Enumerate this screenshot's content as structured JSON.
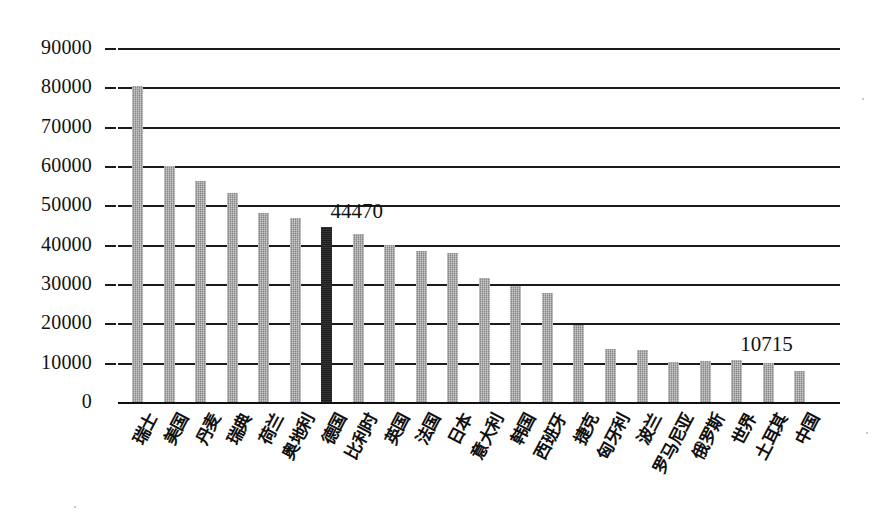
{
  "chart_data": {
    "type": "bar",
    "title": "",
    "xlabel": "",
    "ylabel": "",
    "ylim": [
      0,
      90000
    ],
    "yticks": [
      0,
      10000,
      20000,
      30000,
      40000,
      50000,
      60000,
      70000,
      80000,
      90000
    ],
    "ytick_labels": [
      "0",
      "10000",
      "20000",
      "30000",
      "40000",
      "50000",
      "60000",
      "70000",
      "80000",
      "90000"
    ],
    "grid": true,
    "legend": "none",
    "bar_color": "#9c9c9c",
    "highlight_color": "#262626",
    "highlight_category": "德国",
    "categories": [
      "瑞士",
      "美国",
      "丹麦",
      "瑞典",
      "荷兰",
      "奥地利",
      "德国",
      "比利时",
      "英国",
      "法国",
      "日本",
      "意大利",
      "韩国",
      "西班牙",
      "捷克",
      "匈牙利",
      "波兰",
      "罗马尼亚",
      "俄罗斯",
      "世界",
      "土耳其",
      "中国"
    ],
    "values": [
      80300,
      60000,
      56300,
      53100,
      48000,
      46700,
      44470,
      42800,
      39800,
      38300,
      38000,
      31500,
      29500,
      27700,
      19500,
      13600,
      13200,
      10300,
      10400,
      10715,
      9900,
      7900
    ],
    "data_labels": [
      {
        "category": "德国",
        "text": "44470"
      },
      {
        "category": "世界",
        "text": "10715"
      }
    ]
  }
}
